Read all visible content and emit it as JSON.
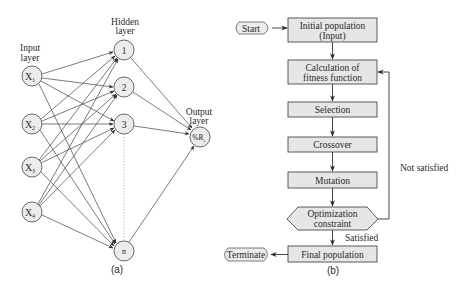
{
  "colors": {
    "line": "#3a3a3a",
    "node_fill": "#ececec",
    "node_stroke": "#5a5a5a",
    "box_fill": "#e6e6e6",
    "box_stroke": "#4a4a4a",
    "text": "#2a2a2a"
  },
  "panel_a": {
    "caption": "(a)",
    "input_layer": {
      "label_line1": "Input",
      "label_line2": "layer",
      "nodes": [
        {
          "base": "X",
          "sub": "1"
        },
        {
          "base": "X",
          "sub": "2"
        },
        {
          "base": "X",
          "sub": "3"
        },
        {
          "base": "X",
          "sub": "4"
        }
      ]
    },
    "hidden_layer": {
      "label_line1": "Hidden",
      "label_line2": "layer",
      "nodes": [
        "1",
        "2",
        "3",
        "n"
      ]
    },
    "output_layer": {
      "label_line1": "Output",
      "label_line2": "layer",
      "node": {
        "base": "%R",
        "sub": "e"
      }
    }
  },
  "panel_b": {
    "caption": "(b)",
    "start": "Start",
    "terminate": "Terminate",
    "steps": {
      "initial_line1": "Initial population",
      "initial_line2": "(Input)",
      "fitness_line1": "Calculation of",
      "fitness_line2": "fitness function",
      "selection": "Selection",
      "crossover": "Crossover",
      "mutation": "Mutation",
      "constraint_line1": "Optimization",
      "constraint_line2": "constraint",
      "final": "Final population"
    },
    "edge_labels": {
      "not_satisfied": "Not satisfied",
      "satisfied": "Satisfied"
    }
  }
}
